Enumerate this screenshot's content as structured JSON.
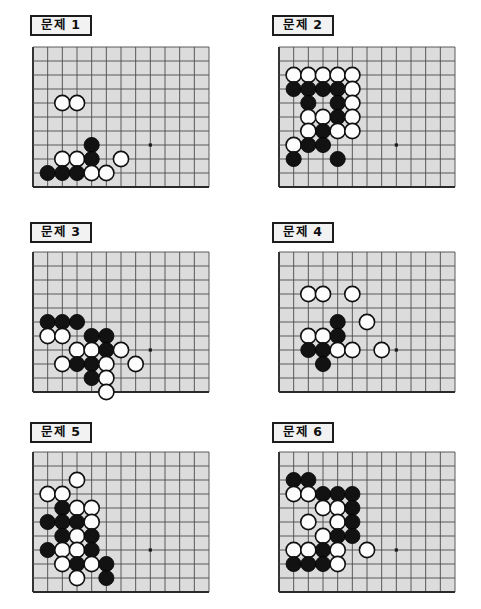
{
  "page": {
    "background_color": "#ffffff",
    "board_color": "#dcdcdc",
    "grid_color": "#4a4a4a",
    "edge_color": "#2a2a2a",
    "black_stone_color": "#121212",
    "white_stone_color": "#fdfdfd"
  },
  "layout": {
    "columns": 2,
    "rows": 3,
    "cell_px": 14.2,
    "stone_radius_px": 7.6
  },
  "problems": [
    {
      "id": "problem-1",
      "label": "문제 1",
      "label_pos": {
        "x": 30,
        "y": 15,
        "w": 62
      },
      "board_pos": {
        "x": 33,
        "y": 47,
        "w": 176,
        "h": 140
      },
      "grid": {
        "cols": 12,
        "rows": 10
      },
      "star_points": [
        {
          "col": 8,
          "row": 7
        }
      ],
      "stones": [
        {
          "color": "white",
          "col": 2,
          "row": 4
        },
        {
          "color": "white",
          "col": 3,
          "row": 4
        },
        {
          "color": "black",
          "col": 4,
          "row": 7
        },
        {
          "color": "white",
          "col": 2,
          "row": 8
        },
        {
          "color": "white",
          "col": 3,
          "row": 8
        },
        {
          "color": "black",
          "col": 4,
          "row": 8
        },
        {
          "color": "white",
          "col": 6,
          "row": 8
        },
        {
          "color": "black",
          "col": 1,
          "row": 9
        },
        {
          "color": "black",
          "col": 2,
          "row": 9
        },
        {
          "color": "black",
          "col": 3,
          "row": 9
        },
        {
          "color": "white",
          "col": 4,
          "row": 9
        },
        {
          "color": "white",
          "col": 5,
          "row": 9
        }
      ]
    },
    {
      "id": "problem-2",
      "label": "문제 2",
      "label_pos": {
        "x": 272,
        "y": 15,
        "w": 62
      },
      "board_pos": {
        "x": 279,
        "y": 47,
        "w": 176,
        "h": 140
      },
      "grid": {
        "cols": 12,
        "rows": 10
      },
      "star_points": [
        {
          "col": 8,
          "row": 7
        }
      ],
      "stones": [
        {
          "color": "white",
          "col": 1,
          "row": 2
        },
        {
          "color": "white",
          "col": 2,
          "row": 2
        },
        {
          "color": "white",
          "col": 3,
          "row": 2
        },
        {
          "color": "white",
          "col": 4,
          "row": 2
        },
        {
          "color": "white",
          "col": 5,
          "row": 2
        },
        {
          "color": "black",
          "col": 1,
          "row": 3
        },
        {
          "color": "black",
          "col": 2,
          "row": 3
        },
        {
          "color": "black",
          "col": 3,
          "row": 3
        },
        {
          "color": "black",
          "col": 4,
          "row": 3
        },
        {
          "color": "white",
          "col": 5,
          "row": 3
        },
        {
          "color": "black",
          "col": 2,
          "row": 4
        },
        {
          "color": "black",
          "col": 4,
          "row": 4
        },
        {
          "color": "white",
          "col": 5,
          "row": 4
        },
        {
          "color": "white",
          "col": 2,
          "row": 5
        },
        {
          "color": "white",
          "col": 3,
          "row": 5
        },
        {
          "color": "black",
          "col": 4,
          "row": 5
        },
        {
          "color": "white",
          "col": 5,
          "row": 5
        },
        {
          "color": "white",
          "col": 2,
          "row": 6
        },
        {
          "color": "black",
          "col": 3,
          "row": 6
        },
        {
          "color": "white",
          "col": 4,
          "row": 6
        },
        {
          "color": "white",
          "col": 5,
          "row": 6
        },
        {
          "color": "white",
          "col": 1,
          "row": 7
        },
        {
          "color": "black",
          "col": 2,
          "row": 7
        },
        {
          "color": "black",
          "col": 3,
          "row": 7
        },
        {
          "color": "black",
          "col": 1,
          "row": 8
        },
        {
          "color": "black",
          "col": 4,
          "row": 8
        }
      ]
    },
    {
      "id": "problem-3",
      "label": "문제 3",
      "label_pos": {
        "x": 30,
        "y": 222,
        "w": 62
      },
      "board_pos": {
        "x": 33,
        "y": 252,
        "w": 176,
        "h": 140
      },
      "grid": {
        "cols": 12,
        "rows": 10
      },
      "star_points": [
        {
          "col": 8,
          "row": 7
        }
      ],
      "stones": [
        {
          "color": "black",
          "col": 1,
          "row": 5
        },
        {
          "color": "black",
          "col": 2,
          "row": 5
        },
        {
          "color": "black",
          "col": 3,
          "row": 5
        },
        {
          "color": "white",
          "col": 1,
          "row": 6
        },
        {
          "color": "white",
          "col": 2,
          "row": 6
        },
        {
          "color": "black",
          "col": 4,
          "row": 6
        },
        {
          "color": "black",
          "col": 5,
          "row": 6
        },
        {
          "color": "white",
          "col": 3,
          "row": 7
        },
        {
          "color": "white",
          "col": 4,
          "row": 7
        },
        {
          "color": "black",
          "col": 5,
          "row": 7
        },
        {
          "color": "white",
          "col": 6,
          "row": 7
        },
        {
          "color": "white",
          "col": 2,
          "row": 8
        },
        {
          "color": "black",
          "col": 3,
          "row": 8
        },
        {
          "color": "black",
          "col": 4,
          "row": 8
        },
        {
          "color": "white",
          "col": 5,
          "row": 8
        },
        {
          "color": "white",
          "col": 7,
          "row": 8
        },
        {
          "color": "black",
          "col": 4,
          "row": 9
        },
        {
          "color": "white",
          "col": 5,
          "row": 9
        },
        {
          "color": "white",
          "col": 5,
          "row": 10
        }
      ]
    },
    {
      "id": "problem-4",
      "label": "문제 4",
      "label_pos": {
        "x": 272,
        "y": 222,
        "w": 62
      },
      "board_pos": {
        "x": 279,
        "y": 252,
        "w": 176,
        "h": 140
      },
      "grid": {
        "cols": 12,
        "rows": 10
      },
      "star_points": [
        {
          "col": 8,
          "row": 7
        }
      ],
      "stones": [
        {
          "color": "white",
          "col": 2,
          "row": 3
        },
        {
          "color": "white",
          "col": 3,
          "row": 3
        },
        {
          "color": "white",
          "col": 5,
          "row": 3
        },
        {
          "color": "black",
          "col": 4,
          "row": 5
        },
        {
          "color": "white",
          "col": 6,
          "row": 5
        },
        {
          "color": "white",
          "col": 2,
          "row": 6
        },
        {
          "color": "white",
          "col": 3,
          "row": 6
        },
        {
          "color": "black",
          "col": 4,
          "row": 6
        },
        {
          "color": "black",
          "col": 2,
          "row": 7
        },
        {
          "color": "black",
          "col": 3,
          "row": 7
        },
        {
          "color": "white",
          "col": 4,
          "row": 7
        },
        {
          "color": "white",
          "col": 5,
          "row": 7
        },
        {
          "color": "white",
          "col": 7,
          "row": 7
        },
        {
          "color": "black",
          "col": 3,
          "row": 8
        }
      ]
    },
    {
      "id": "problem-5",
      "label": "문제 5",
      "label_pos": {
        "x": 30,
        "y": 422,
        "w": 62
      },
      "board_pos": {
        "x": 33,
        "y": 452,
        "w": 176,
        "h": 140
      },
      "grid": {
        "cols": 12,
        "rows": 10
      },
      "star_points": [
        {
          "col": 8,
          "row": 7
        }
      ],
      "stones": [
        {
          "color": "white",
          "col": 3,
          "row": 2
        },
        {
          "color": "white",
          "col": 1,
          "row": 3
        },
        {
          "color": "white",
          "col": 2,
          "row": 3
        },
        {
          "color": "black",
          "col": 2,
          "row": 4
        },
        {
          "color": "white",
          "col": 3,
          "row": 4
        },
        {
          "color": "white",
          "col": 4,
          "row": 4
        },
        {
          "color": "black",
          "col": 1,
          "row": 5
        },
        {
          "color": "black",
          "col": 2,
          "row": 5
        },
        {
          "color": "black",
          "col": 3,
          "row": 5
        },
        {
          "color": "white",
          "col": 4,
          "row": 5
        },
        {
          "color": "black",
          "col": 2,
          "row": 6
        },
        {
          "color": "white",
          "col": 3,
          "row": 6
        },
        {
          "color": "black",
          "col": 4,
          "row": 6
        },
        {
          "color": "black",
          "col": 1,
          "row": 7
        },
        {
          "color": "white",
          "col": 2,
          "row": 7
        },
        {
          "color": "white",
          "col": 3,
          "row": 7
        },
        {
          "color": "black",
          "col": 4,
          "row": 7
        },
        {
          "color": "white",
          "col": 2,
          "row": 8
        },
        {
          "color": "black",
          "col": 3,
          "row": 8
        },
        {
          "color": "white",
          "col": 4,
          "row": 8
        },
        {
          "color": "black",
          "col": 5,
          "row": 8
        },
        {
          "color": "white",
          "col": 3,
          "row": 9
        },
        {
          "color": "black",
          "col": 5,
          "row": 9
        }
      ]
    },
    {
      "id": "problem-6",
      "label": "문제 6",
      "label_pos": {
        "x": 272,
        "y": 422,
        "w": 62
      },
      "board_pos": {
        "x": 279,
        "y": 452,
        "w": 176,
        "h": 140
      },
      "grid": {
        "cols": 12,
        "rows": 10
      },
      "star_points": [
        {
          "col": 8,
          "row": 7
        }
      ],
      "stones": [
        {
          "color": "black",
          "col": 1,
          "row": 2
        },
        {
          "color": "black",
          "col": 2,
          "row": 2
        },
        {
          "color": "white",
          "col": 1,
          "row": 3
        },
        {
          "color": "white",
          "col": 2,
          "row": 3
        },
        {
          "color": "black",
          "col": 3,
          "row": 3
        },
        {
          "color": "black",
          "col": 4,
          "row": 3
        },
        {
          "color": "black",
          "col": 5,
          "row": 3
        },
        {
          "color": "white",
          "col": 3,
          "row": 4
        },
        {
          "color": "white",
          "col": 4,
          "row": 4
        },
        {
          "color": "black",
          "col": 5,
          "row": 4
        },
        {
          "color": "white",
          "col": 2,
          "row": 5
        },
        {
          "color": "white",
          "col": 4,
          "row": 5
        },
        {
          "color": "black",
          "col": 5,
          "row": 5
        },
        {
          "color": "white",
          "col": 3,
          "row": 6
        },
        {
          "color": "black",
          "col": 4,
          "row": 6
        },
        {
          "color": "black",
          "col": 5,
          "row": 6
        },
        {
          "color": "white",
          "col": 1,
          "row": 7
        },
        {
          "color": "white",
          "col": 2,
          "row": 7
        },
        {
          "color": "black",
          "col": 3,
          "row": 7
        },
        {
          "color": "white",
          "col": 4,
          "row": 7
        },
        {
          "color": "white",
          "col": 6,
          "row": 7
        },
        {
          "color": "black",
          "col": 1,
          "row": 8
        },
        {
          "color": "black",
          "col": 2,
          "row": 8
        },
        {
          "color": "black",
          "col": 3,
          "row": 8
        },
        {
          "color": "white",
          "col": 4,
          "row": 8
        }
      ]
    }
  ]
}
